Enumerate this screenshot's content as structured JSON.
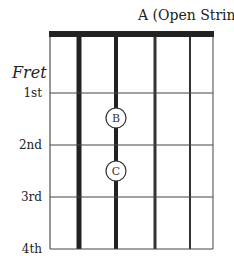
{
  "diagram": {
    "title": "A (Open String)",
    "fret_axis_label": "Fret",
    "frets": [
      {
        "label": "1st",
        "y": 93
      },
      {
        "label": "2nd",
        "y": 145
      },
      {
        "label": "3rd",
        "y": 197
      },
      {
        "label": "4th",
        "y": 249
      }
    ],
    "strings_x": [
      50,
      79,
      116,
      155,
      190,
      213
    ],
    "string_widths": [
      1,
      5,
      4,
      3,
      2,
      1
    ],
    "nut": {
      "y": 31,
      "height": 6
    },
    "notes": [
      {
        "label": "B",
        "x": 116,
        "y": 118
      },
      {
        "label": "C",
        "x": 116,
        "y": 171
      }
    ]
  }
}
